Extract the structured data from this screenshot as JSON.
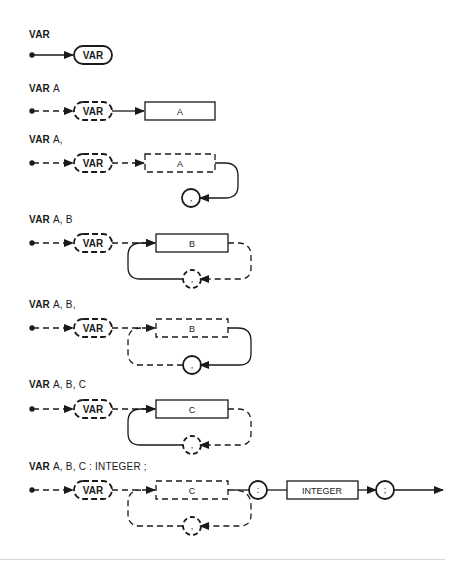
{
  "diagrams": [
    {
      "keyword": "VAR",
      "rest": ""
    },
    {
      "keyword": "VAR",
      "rest": "A"
    },
    {
      "keyword": "VAR",
      "rest": "A,"
    },
    {
      "keyword": "VAR",
      "rest": "A, B"
    },
    {
      "keyword": "VAR",
      "rest": "A, B,"
    },
    {
      "keyword": "VAR",
      "rest": "A, B, C"
    },
    {
      "keyword": "VAR",
      "rest": "A, B, C : INTEGER ;"
    }
  ],
  "nodes": {
    "var": "VAR",
    "a": "A",
    "b": "B",
    "c": "C",
    "comma": ",",
    "colon": ":",
    "integer": "INTEGER",
    "semicolon": ";"
  }
}
